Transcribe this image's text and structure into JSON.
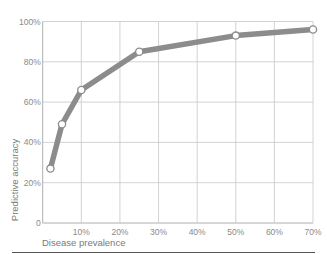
{
  "chart_data": {
    "type": "line",
    "title": "",
    "xlabel": "Disease prevalence",
    "ylabel": "Predictive accuracy",
    "x_ticks": [
      {
        "value": 10,
        "label": "10%"
      },
      {
        "value": 20,
        "label": "20%"
      },
      {
        "value": 30,
        "label": "30%"
      },
      {
        "value": 40,
        "label": "40%"
      },
      {
        "value": 50,
        "label": "50%"
      },
      {
        "value": 60,
        "label": "60%"
      },
      {
        "value": 70,
        "label": "70%"
      }
    ],
    "y_ticks": [
      {
        "value": 0,
        "label": "0"
      },
      {
        "value": 20,
        "label": "20%"
      },
      {
        "value": 40,
        "label": "40%"
      },
      {
        "value": 60,
        "label": "60%"
      },
      {
        "value": 80,
        "label": "80%"
      },
      {
        "value": 100,
        "label": "100%"
      }
    ],
    "xlim": [
      0,
      70
    ],
    "ylim": [
      0,
      100
    ],
    "grid": true,
    "legend": null,
    "series": [
      {
        "name": "Predictive accuracy",
        "x": [
          2,
          5,
          10,
          25,
          50,
          70
        ],
        "values": [
          27,
          49,
          66,
          85,
          93,
          96
        ]
      }
    ],
    "colors": {
      "line": "#8c8c8c",
      "marker_fill": "#ffffff",
      "marker_stroke": "#8c8c8c",
      "grid": "#c8c8c8",
      "axis": "#9a9a9a"
    }
  }
}
